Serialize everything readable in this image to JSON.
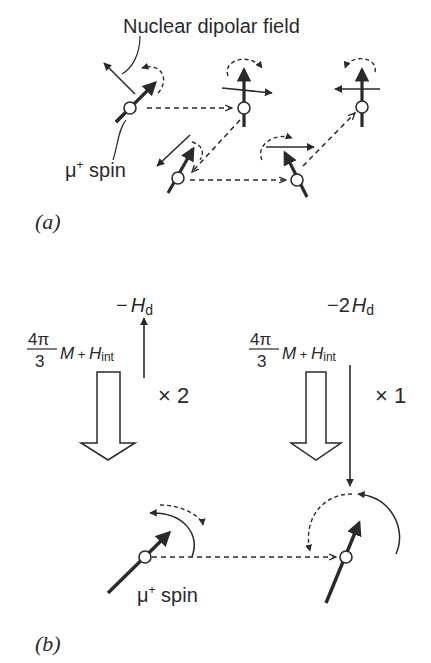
{
  "panel_a": {
    "label": "(a)",
    "nuclear_dipolar_field_label": "Nuclear dipolar field",
    "muon_spin_label_prefix": "μ",
    "muon_spin_label_sup": "+",
    "muon_spin_label_suffix": " spin"
  },
  "panel_b": {
    "label": "(b)",
    "left": {
      "field_label_prefix": "−",
      "field_label_H": "H",
      "field_label_sub": "d",
      "frac_num": "4π",
      "frac_den": "3",
      "M": "M",
      "plus": " + ",
      "H": "H",
      "int_sub": "int",
      "multiplier": "× 2"
    },
    "right": {
      "field_label_prefix": "−2",
      "field_label_H": "H",
      "field_label_sub": "d",
      "frac_num": "4π",
      "frac_den": "3",
      "M": "M",
      "plus": " + ",
      "H": "H",
      "int_sub": "int",
      "multiplier": "× 1"
    },
    "muon_spin_label_prefix": "μ",
    "muon_spin_label_sup": "+",
    "muon_spin_label_suffix": " spin"
  },
  "colors": {
    "ink": "#2a2a2a",
    "background": "#ffffff"
  }
}
